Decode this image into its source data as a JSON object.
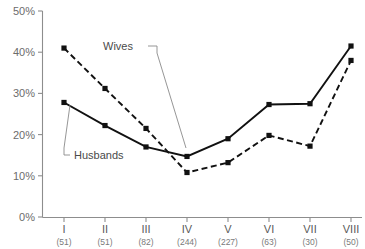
{
  "chart_data": {
    "type": "line",
    "title": "",
    "xlabel": "",
    "ylabel": "",
    "ylim": [
      0,
      50
    ],
    "yticks": [
      0,
      10,
      20,
      30,
      40,
      50
    ],
    "ytick_labels": [
      "0%",
      "10%",
      "20%",
      "30%",
      "40%",
      "50%"
    ],
    "grid": false,
    "legend_position": "inline-annotations",
    "categories": [
      "I",
      "II",
      "III",
      "IV",
      "V",
      "VI",
      "VII",
      "VIII"
    ],
    "category_counts": [
      "(51)",
      "(51)",
      "(82)",
      "(244)",
      "(227)",
      "(63)",
      "(30)",
      "(50)"
    ],
    "series": [
      {
        "name": "Husbands",
        "style": "solid",
        "marker": "filled-square",
        "color": "#111111",
        "values": [
          27.8,
          22.2,
          17.0,
          14.7,
          19.0,
          27.3,
          27.5,
          41.5
        ]
      },
      {
        "name": "Wives",
        "style": "dashed",
        "marker": "filled-square",
        "color": "#111111",
        "values": [
          41.0,
          31.2,
          21.5,
          10.8,
          13.2,
          19.8,
          17.2,
          38.0
        ]
      }
    ],
    "annotations": [
      {
        "text": "Wives",
        "target_series": "Wives",
        "target_category": "IV"
      },
      {
        "text": "Husbands",
        "target_series": "Husbands",
        "target_category": "I"
      }
    ]
  },
  "axis": {
    "y_axis_color": "#8d8d8d",
    "x_axis_color": "#8d8d8d",
    "tick_label_color": "#6c6c6c"
  }
}
